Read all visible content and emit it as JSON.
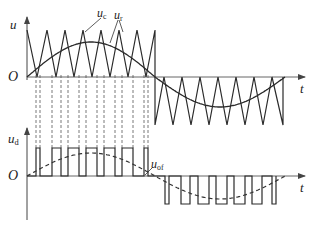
{
  "diagram": {
    "type": "spwm-waveform",
    "colors": {
      "line": "#2a2a2a",
      "axis": "#555555",
      "dashed": "#555555",
      "background": "#ffffff"
    },
    "top_plot": {
      "y_axis_label": "u",
      "origin_label": "O",
      "x_axis_label": "t",
      "carrier_label_main": "u",
      "carrier_label_sub": "c",
      "reference_label_main": "u",
      "reference_label_sub": "r",
      "axis_x": 27,
      "axis_top": 17,
      "axis_bottom": 80,
      "baseline_y": 77,
      "axis_end_x": 305,
      "carrier": {
        "start_x": 27,
        "half_period_end_x": 155,
        "end_x": 285,
        "peak_y": 30,
        "trough_y": 125,
        "positive_half_peaks_x": [
          27,
          47,
          65,
          83,
          101,
          119,
          137,
          155
        ],
        "positive_half_valleys_x": [
          37,
          56,
          74,
          92,
          110,
          128,
          146
        ],
        "negative_half_valleys_x": [
          155,
          173,
          191,
          209,
          227,
          245,
          263,
          283
        ],
        "negative_half_peaks_x": [
          164,
          182,
          200,
          218,
          236,
          254,
          272
        ]
      },
      "reference": {
        "zero1_x": 27,
        "zero2_x": 155,
        "zero3_x": 285,
        "pos_peak_y": 42,
        "neg_peak_y": 107
      }
    },
    "bottom_plot": {
      "y_axis_label_main": "u",
      "y_axis_label_sub": "d",
      "origin_label": "O",
      "x_axis_label": "t",
      "fundamental_label_main": "u",
      "fundamental_label_sub": "of",
      "axis_x": 27,
      "axis_top": 128,
      "axis_bottom": 220,
      "baseline_y": 176,
      "axis_end_x": 305,
      "pulse_high_y": 148,
      "pulse_low_y": 204,
      "positive_pulses": [
        [
          36,
          40
        ],
        [
          52,
          61
        ],
        [
          68,
          79
        ],
        [
          86,
          97
        ],
        [
          104,
          115
        ],
        [
          122,
          133
        ],
        [
          144,
          148
        ]
      ],
      "negative_pulses": [
        [
          165,
          169
        ],
        [
          181,
          190
        ],
        [
          198,
          209
        ],
        [
          216,
          227
        ],
        [
          234,
          245
        ],
        [
          252,
          262
        ],
        [
          272,
          276
        ]
      ],
      "fundamental": {
        "pos_peak_y": 153,
        "neg_peak_y": 199
      }
    },
    "dashed_projection_lines_x": [
      36,
      40,
      52,
      61,
      68,
      79,
      86,
      97,
      104,
      115,
      122,
      133,
      144,
      148
    ]
  }
}
